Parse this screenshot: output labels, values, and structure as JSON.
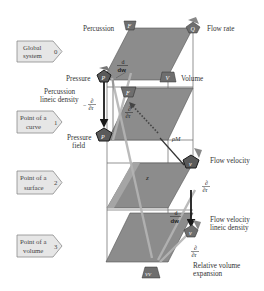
{
  "diagram": {
    "colors": {
      "plane": "#8c8c8c",
      "plane_light": "#a8a8a8",
      "node": "#6e6e6e",
      "node_dark": "#2a2a2a",
      "tag_fill": "#e6e6e6",
      "line": "#555555",
      "arrow": "#1a1a1a"
    },
    "levels": [
      {
        "line1": "Global",
        "line2": "system",
        "index": "0"
      },
      {
        "line1": "Point of a",
        "line2": "curve",
        "index": "1"
      },
      {
        "line1": "Point of a",
        "line2": "surface",
        "index": "2"
      },
      {
        "line1": "Point of a",
        "line2": "volume",
        "index": "3"
      }
    ],
    "nodes": {
      "percussion": {
        "label": "Percussion",
        "symbol": "F"
      },
      "flow_rate": {
        "label": "Flow rate",
        "symbol": "Q"
      },
      "pressure": {
        "label": "Pressure",
        "symbol": "P"
      },
      "volume": {
        "label": "Volume",
        "symbol": "V"
      },
      "percussion_lineic": {
        "label_line1": "Percussion",
        "label_line2": "lineic density",
        "symbol": "F"
      },
      "pressure_field": {
        "label_line1": "Pressure",
        "label_line2": "field",
        "symbol": "P"
      },
      "flow_velocity": {
        "label": "Flow velocity",
        "symbol": "v"
      },
      "flow_velocity_lineic": {
        "label_line1": "Flow velocity",
        "label_line2": "lineic density",
        "symbol": "v"
      },
      "relative_volume_expansion": {
        "label_line1": "Relative volume",
        "label_line2": "expansion",
        "symbol": "VV"
      }
    },
    "operators": {
      "d_dw_top": {
        "num": "d",
        "den": "dw"
      },
      "d_dr_left": {
        "sign": "−",
        "num": "∂",
        "den": "∂r"
      },
      "d_dr_mid": {
        "num": "∂",
        "den": "∂r"
      },
      "d_dr_right": {
        "num": "∂",
        "den": "∂r"
      },
      "d_dw_bottom": {
        "num": "d",
        "den": "dw"
      },
      "d_dr_bottom": {
        "num": "∂",
        "den": "∂r"
      }
    },
    "annotations": {
      "rho_m": "ρM",
      "z": "z"
    }
  }
}
